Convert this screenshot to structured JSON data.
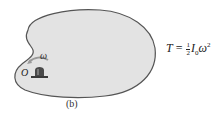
{
  "figure": {
    "caption": "(b)",
    "pivot_label": "O",
    "angular_velocity_label": "ω",
    "equation": {
      "lhs": "T",
      "equals": "=",
      "fraction_numerator": "1",
      "fraction_denominator": "2",
      "symbol_I": "I",
      "subscript_I": "0",
      "symbol_omega": "ω",
      "superscript": "2"
    },
    "colors": {
      "body_fill": "#e3e3e3",
      "body_stroke": "#555555",
      "pivot_fill": "#3a3a3a",
      "arrow": "#9a9a9a"
    }
  }
}
